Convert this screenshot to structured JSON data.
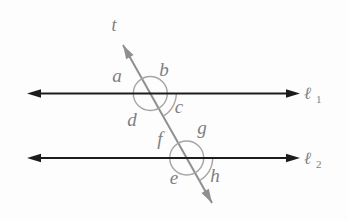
{
  "diagram": {
    "type": "parallel-lines-cut-by-transversal",
    "transversal": {
      "label": "t"
    },
    "parallel_lines": [
      {
        "label": "ℓ",
        "subscript": "1"
      },
      {
        "label": "ℓ",
        "subscript": "2"
      }
    ],
    "intersections": [
      {
        "with_line": "ℓ1",
        "angles": {
          "upper_left": "a",
          "upper_right": "b",
          "lower_right": "c",
          "lower_left": "d"
        }
      },
      {
        "with_line": "ℓ2",
        "angles": {
          "upper_left": "f",
          "upper_right": "g",
          "lower_right": "h",
          "lower_left": "e"
        }
      }
    ],
    "colors": {
      "parallel_line": "#1c1c1c",
      "transversal": "#8f8f8f",
      "angle_arc": "#a5a5a5",
      "label": "#7f7f7f",
      "background": "#fdfdfd"
    }
  }
}
